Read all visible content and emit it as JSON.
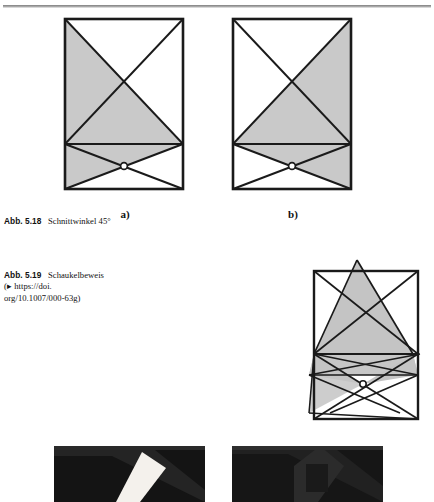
{
  "page": {
    "background": "#ffffff",
    "rule_color": "#8d8d8d"
  },
  "figure_518": {
    "panels": [
      {
        "id": "a",
        "label": "a)",
        "shaded_side": "left"
      },
      {
        "id": "b",
        "label": "b)",
        "shaded_side": "right"
      }
    ],
    "caption_lead": "Abb. 5.18",
    "caption_text": "Schnittwinkel 45°",
    "fill_color": "#c9c9c9",
    "stroke_color": "#1a1a1a"
  },
  "figure_519": {
    "caption_lead": "Abb. 5.19",
    "caption_text": "Schaukelbeweis",
    "caption_line2": "(▸ https://doi.",
    "caption_line3": "org/10.1007/000-63g)",
    "fill_color": "#c4c4c4",
    "stroke_color": "#1a1a1a"
  },
  "photos": [
    {
      "id": "photo-left",
      "alt": "dark photo of folded paper with white diagonal strip"
    },
    {
      "id": "photo-right",
      "alt": "dark photo of folded paper with triangular flap"
    }
  ]
}
